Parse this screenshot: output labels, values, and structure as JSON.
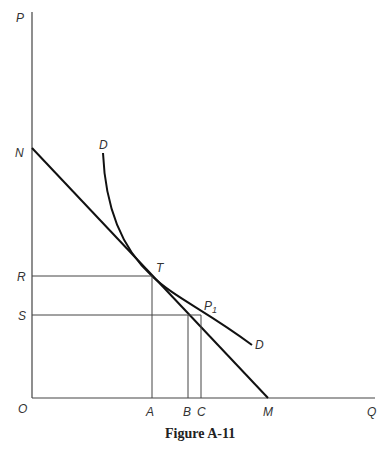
{
  "figure": {
    "caption": "Figure A-11",
    "axes": {
      "y_label": "P",
      "x_label": "Q",
      "origin_label": "O"
    },
    "y_points": {
      "N": "N",
      "R": "R",
      "S": "S"
    },
    "x_points": {
      "A": "A",
      "B": "B",
      "C": "C",
      "M": "M"
    },
    "curve_points": {
      "T": "T",
      "P1": "P",
      "P1_sub": "1"
    },
    "demand_labels": {
      "top": "D",
      "bottom": "D"
    },
    "elements": [
      "vertical axis P",
      "horizontal axis Q",
      "straight line NM tangent to demand curve DD at T",
      "demand curve DD through T and P1",
      "horizontal guides R-T and S-P1",
      "vertical guides T-A, B, C-P1"
    ]
  }
}
